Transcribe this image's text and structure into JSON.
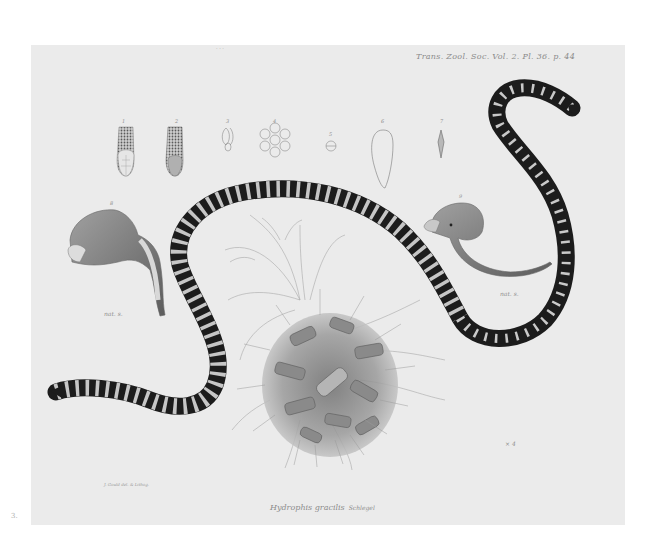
{
  "plate": {
    "header_reference": "Trans. Zool. Soc. Vol. 2. Pl. 36. p. 44",
    "top_marks": "· · ·",
    "caption_species": "Hydrophis gracilis",
    "caption_authority": "Schlegel",
    "artist_credit": "J. Gould del. & Lithog.",
    "plate_number": "3.",
    "colors": {
      "page_background": "#ffffff",
      "paper": "#ebebeb",
      "snake_dark": "#1c1c1c",
      "snake_band": "#c8c8c8",
      "ink_line": "#8a8a8a",
      "coral": "#7a7a7a"
    }
  },
  "figures": {
    "labels": [
      "1",
      "2",
      "3",
      "4",
      "5",
      "6",
      "7",
      "8",
      "9"
    ],
    "scale_notes": [
      "nat. s.",
      "nat. s.",
      "× 4"
    ]
  }
}
